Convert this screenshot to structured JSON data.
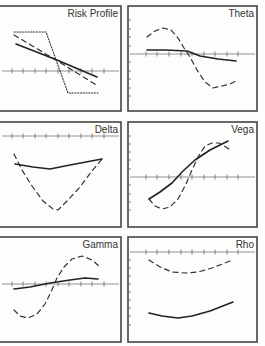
{
  "chart_data": [
    {
      "type": "line",
      "title": "Risk Profile",
      "frame": {
        "x": -2,
        "y": 6,
        "w": 123,
        "h": 105
      },
      "axis_y": 71,
      "axis_x0": 0,
      "axis_x1": 121,
      "ticks_x": [
        12,
        23,
        35,
        46,
        58,
        69,
        81,
        92,
        104
      ],
      "left_ticks": [],
      "series": [
        {
          "name": "expiration",
          "style": "dotted",
          "points": [
            [
              14,
              32
            ],
            [
              46,
              32
            ],
            [
              68,
              93
            ],
            [
              98,
              93
            ]
          ]
        },
        {
          "name": "intermediate",
          "style": "dashed",
          "points": [
            [
              14,
              35
            ],
            [
              56,
              60
            ],
            [
              98,
              86
            ]
          ]
        },
        {
          "name": "current",
          "style": "solid",
          "points": [
            [
              16,
              44
            ],
            [
              57,
              60
            ],
            [
              97,
              77
            ]
          ]
        }
      ]
    },
    {
      "type": "line",
      "title": "Theta",
      "frame": {
        "x": 128,
        "y": 6,
        "w": 129,
        "h": 105
      },
      "axis_y": 54,
      "axis_x0": 128,
      "axis_x1": 257,
      "ticks_x": [
        146,
        157,
        169,
        181,
        192,
        204,
        215,
        227,
        238
      ],
      "left_ticks": [
        20,
        29,
        37,
        46,
        62,
        71,
        79,
        88,
        96
      ],
      "series": [
        {
          "name": "dashed",
          "style": "dashed",
          "points": [
            [
              147,
              37
            ],
            [
              155,
              31
            ],
            [
              163,
              28
            ],
            [
              171,
              30
            ],
            [
              178,
              38
            ],
            [
              184,
              48
            ],
            [
              190,
              57
            ],
            [
              197,
              70
            ],
            [
              205,
              82
            ],
            [
              213,
              88
            ],
            [
              222,
              86
            ],
            [
              230,
              84
            ],
            [
              236,
              81
            ]
          ]
        },
        {
          "name": "solid",
          "style": "solid",
          "points": [
            [
              147,
              50
            ],
            [
              165,
              50
            ],
            [
              187,
              51
            ],
            [
              200,
              56
            ],
            [
              218,
              59
            ],
            [
              236,
              61
            ]
          ]
        }
      ]
    },
    {
      "type": "line",
      "title": "Delta",
      "frame": {
        "x": -2,
        "y": 122,
        "w": 123,
        "h": 105
      },
      "axis_y": 136,
      "axis_x0": 0,
      "axis_x1": 121,
      "ticks_x": [
        12,
        23,
        35,
        46,
        58,
        69,
        81,
        92,
        104
      ],
      "left_ticks": [],
      "series": [
        {
          "name": "dashed",
          "style": "dashed",
          "points": [
            [
              14,
              154
            ],
            [
              22,
              170
            ],
            [
              32,
              186
            ],
            [
              43,
              201
            ],
            [
              53,
              209
            ],
            [
              58,
              210
            ],
            [
              68,
              200
            ],
            [
              80,
              187
            ],
            [
              92,
              171
            ],
            [
              102,
              159
            ]
          ]
        },
        {
          "name": "solid",
          "style": "solid",
          "points": [
            [
              15,
              164
            ],
            [
              33,
              167
            ],
            [
              50,
              169
            ],
            [
              70,
              165
            ],
            [
              102,
              159
            ]
          ]
        }
      ]
    },
    {
      "type": "line",
      "title": "Vega",
      "frame": {
        "x": 128,
        "y": 122,
        "w": 129,
        "h": 105
      },
      "axis_y": 177,
      "axis_x0": 128,
      "axis_x1": 257,
      "ticks_x": [
        146,
        157,
        169,
        181,
        192,
        204,
        215,
        227,
        238
      ],
      "left_ticks": [
        136,
        144,
        152,
        160,
        169,
        185,
        194,
        202,
        210
      ],
      "series": [
        {
          "name": "dashed",
          "style": "dashed",
          "points": [
            [
              149,
              199
            ],
            [
              155,
              206
            ],
            [
              162,
              209
            ],
            [
              170,
              207
            ],
            [
              178,
              199
            ],
            [
              186,
              184
            ],
            [
              192,
              170
            ],
            [
              198,
              157
            ],
            [
              205,
              146
            ],
            [
              212,
              143
            ],
            [
              219,
              143
            ],
            [
              226,
              147
            ],
            [
              230,
              150
            ]
          ]
        },
        {
          "name": "solid",
          "style": "solid",
          "points": [
            [
              149,
              199
            ],
            [
              160,
              192
            ],
            [
              172,
              183
            ],
            [
              182,
              172
            ],
            [
              195,
              160
            ],
            [
              210,
              150
            ],
            [
              228,
              141
            ]
          ]
        }
      ]
    },
    {
      "type": "line",
      "title": "Gamma",
      "frame": {
        "x": -2,
        "y": 237,
        "w": 123,
        "h": 105
      },
      "axis_y": 284,
      "axis_x0": 0,
      "axis_x1": 121,
      "ticks_x": [
        12,
        23,
        35,
        46,
        58,
        69,
        81,
        92,
        104
      ],
      "left_ticks": [],
      "series": [
        {
          "name": "dashed",
          "style": "dashed",
          "points": [
            [
              14,
              310
            ],
            [
              20,
              316
            ],
            [
              28,
              318
            ],
            [
              37,
              314
            ],
            [
              45,
              304
            ],
            [
              51,
              292
            ],
            [
              57,
              278
            ],
            [
              64,
              267
            ],
            [
              72,
              259
            ],
            [
              82,
              256
            ],
            [
              92,
              260
            ],
            [
              99,
              266
            ]
          ]
        },
        {
          "name": "solid",
          "style": "solid",
          "points": [
            [
              14,
              289
            ],
            [
              30,
              287
            ],
            [
              50,
              283
            ],
            [
              70,
              280
            ],
            [
              85,
              278
            ],
            [
              98,
              279
            ]
          ]
        }
      ]
    },
    {
      "type": "line",
      "title": "Rho",
      "frame": {
        "x": 128,
        "y": 237,
        "w": 129,
        "h": 105
      },
      "axis_y": 252,
      "axis_x0": 128,
      "axis_x1": 257,
      "ticks_x": [
        146,
        157,
        169,
        181,
        192,
        204,
        215,
        227,
        238
      ],
      "left_ticks": [
        260,
        268,
        276,
        284,
        292,
        300,
        308,
        316,
        325
      ],
      "series": [
        {
          "name": "dashed",
          "style": "dashed",
          "points": [
            [
              149,
              260
            ],
            [
              160,
              267
            ],
            [
              172,
              272
            ],
            [
              185,
              273
            ],
            [
              198,
              272
            ],
            [
              212,
              268
            ],
            [
              230,
              261
            ]
          ]
        },
        {
          "name": "solid",
          "style": "solid",
          "points": [
            [
              149,
              313
            ],
            [
              162,
              316
            ],
            [
              178,
              318
            ],
            [
              192,
              316
            ],
            [
              210,
              311
            ],
            [
              233,
              302
            ]
          ]
        }
      ]
    }
  ],
  "titles": {
    "risk_profile": "Risk Profile",
    "theta": "Theta",
    "delta": "Delta",
    "vega": "Vega",
    "gamma": "Gamma",
    "rho": "Rho"
  }
}
